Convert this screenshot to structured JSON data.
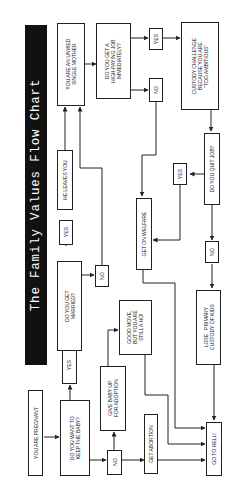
{
  "title": "The Family Values Flow Chart",
  "orientation": "rotated 90deg counter-clockwise",
  "colors": {
    "title_bg": "#111111",
    "title_text": "#ffffff",
    "line": "#222222",
    "background": "#ffffff"
  },
  "nodes": {
    "pregnant": "YOU ARE PREGNANT",
    "keep_baby": "DO YOU WANT TO\nKEEP THE BABY?",
    "yes_keep": "YES",
    "no_keep": "NO",
    "get_married": "DO YOU GET\nMARRIED?",
    "yes_married": "YES",
    "no_married": "NO",
    "he_leaves": "HE LEAVES YOU",
    "unwed_mother": "YOU ARE AN UNWED\nSINGLE MOTHER",
    "high_paying_job": "DO YOU GET A\nHIGH-PAYING JOB\nIMMEDIATELY?",
    "yes_job": "YES",
    "no_job": "NO",
    "custody_challenge": "CUSTODY CHALLENGE\nBECAUSE YOU ARE\n\"TOO AMBITIOUS\"",
    "quit_job": "DO YOU QUIT JOB?",
    "yes_quit": "YES",
    "no_quit": "NO",
    "welfare": "GET ON WELFARE",
    "lose_custody": "LOSE   PRIMARY\nCUSTODY OF KIDS",
    "adoption": "GIVE BABY UP\nFOR ADOPTION",
    "good_move": "GOOD MOVE,\nBUT YOU ARE\nSTILL A HO!",
    "abortion": "GET ABORTION",
    "hell": "GO TO HELL!"
  }
}
